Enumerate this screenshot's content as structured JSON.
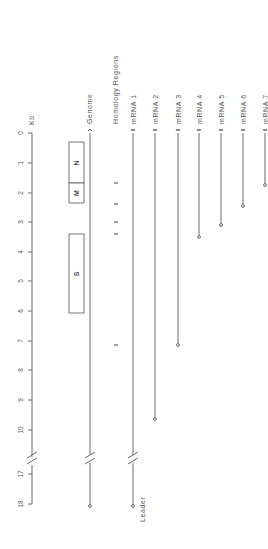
{
  "axis": {
    "unit_label": "Kb",
    "ticks": [
      "0",
      "1",
      "2",
      "3",
      "4",
      "5",
      "6",
      "7",
      "8",
      "9",
      "10",
      "17",
      "18"
    ]
  },
  "tracks": {
    "genome": "Genome",
    "homology": "Homology Regions",
    "mrnas": [
      "mRNA 1",
      "mRNA 2",
      "mRNA 3",
      "mRNA 4",
      "mRNA 5",
      "mRNA 6",
      "mRNA 7"
    ]
  },
  "genes": {
    "N": "N",
    "M": "M",
    "S": "S"
  },
  "leader_label": "Leader",
  "colors": {
    "line": "#6a6a6a",
    "box_stroke": "#666666",
    "text": "#555555"
  }
}
